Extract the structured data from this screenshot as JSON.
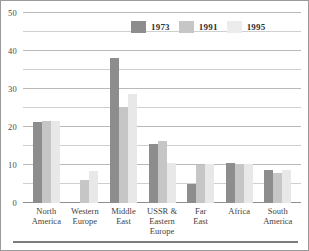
{
  "chart_data": {
    "type": "bar",
    "title": "",
    "xlabel": "",
    "ylabel": "",
    "ylim": [
      0,
      50
    ],
    "yticks": [
      0,
      10,
      20,
      30,
      40,
      50
    ],
    "ytick_labels": [
      "0",
      "10",
      "20",
      "30",
      "40",
      "50"
    ],
    "minor_gridlines": [
      5,
      15,
      25,
      35,
      45
    ],
    "grid": true,
    "legend_position": "top-center",
    "categories": [
      "North America",
      "Western Europe",
      "Middle East",
      "USSR & Eastern Europe",
      "Far East",
      "Africa",
      "South America"
    ],
    "category_lines": [
      [
        "North",
        "America"
      ],
      [
        "Western",
        "Europe"
      ],
      [
        "Middle",
        "East"
      ],
      [
        "USSR &",
        "Eastern",
        "Europe"
      ],
      [
        "Far",
        "East"
      ],
      [
        "Africa"
      ],
      [
        "South",
        "America"
      ]
    ],
    "series": [
      {
        "name": "1973",
        "color": "#8d8d8d",
        "values": [
          21.2,
          0.2,
          38.1,
          15.6,
          5.1,
          10.4,
          8.7
        ]
      },
      {
        "name": "1991",
        "color": "#c6c6c6",
        "values": [
          21.5,
          6.0,
          25.2,
          16.2,
          10.1,
          10.3,
          8.0
        ]
      },
      {
        "name": "1995",
        "color": "#ececec",
        "values": [
          21.6,
          8.5,
          28.6,
          10.6,
          10.3,
          10.2,
          8.7
        ]
      }
    ]
  },
  "legend": {
    "items": [
      {
        "label": "1973"
      },
      {
        "label": "1991"
      },
      {
        "label": "1995"
      }
    ]
  }
}
